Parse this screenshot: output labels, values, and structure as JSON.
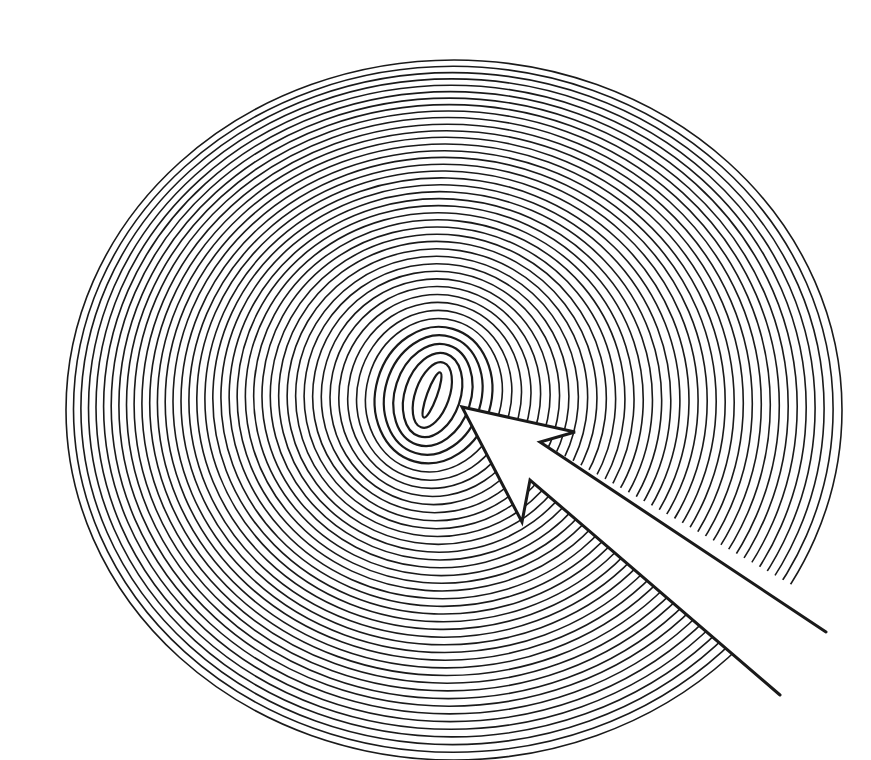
{
  "figure": {
    "description": "Spiral of concentric ellipses with an arrow pointing to its center",
    "colors": {
      "background": "#ffffff",
      "line": "#1a1a1a"
    },
    "spiral": {
      "ring_count": 44,
      "core": {
        "cx": 432,
        "cy": 395,
        "rx": 5,
        "ry": 24,
        "rotation_deg": 20
      },
      "outer": {
        "cx": 444,
        "cy": 394,
        "rx": 388,
        "ry": 350,
        "rotation_deg": 0
      },
      "stroke_width": 1.6,
      "outer_bias": {
        "dx": 10,
        "dy": 16
      }
    },
    "arrow": {
      "tip": [
        462,
        407
      ],
      "right_barb": [
        575,
        432
      ],
      "right_notch": [
        540,
        442
      ],
      "left_barb": [
        522,
        522
      ],
      "left_notch": [
        530,
        480
      ],
      "shaft_upper_end": [
        826,
        632
      ],
      "shaft_lower_end": [
        780,
        695
      ],
      "stroke_width": 3
    }
  }
}
